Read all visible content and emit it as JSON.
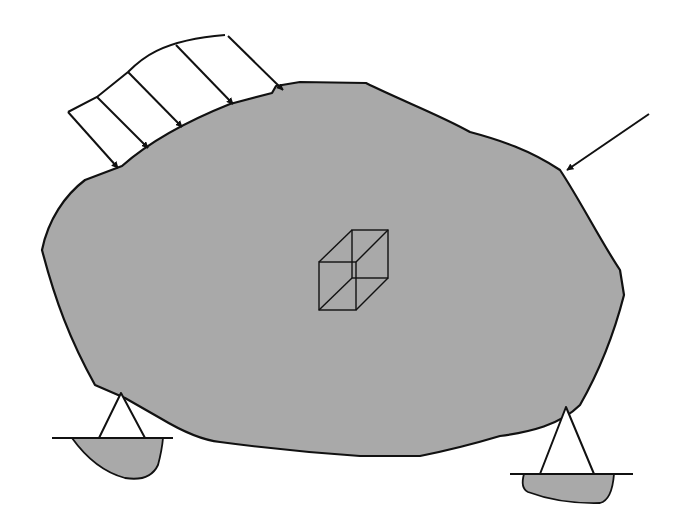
{
  "diagram": {
    "title": "",
    "colors": {
      "background": "#ffffff",
      "body_fill": "#a9a9a9",
      "ground_fill": "#a9a9a9",
      "stroke": "#111111"
    },
    "elements": {
      "body": {
        "label": "",
        "shape": "irregular-blob"
      },
      "distributed_load": {
        "label": "",
        "arrow_count": 5
      },
      "point_load": {
        "label": "",
        "direction": "down-left"
      },
      "volume_element": {
        "label": "",
        "shape": "cube"
      },
      "left_support": {
        "label": "",
        "type": "pin-triangle"
      },
      "right_support": {
        "label": "",
        "type": "pin-triangle"
      }
    }
  }
}
